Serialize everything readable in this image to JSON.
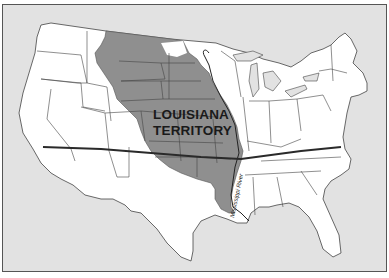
{
  "map": {
    "title": "Louisiana Territory",
    "region_label_line1": "LOUISIANA",
    "region_label_line2": "TERRITORY",
    "river_label": "Mississippi River",
    "colors": {
      "background": "#e2e2e2",
      "land": "#ffffff",
      "territory": "#8f8f8f",
      "borders": "#444444",
      "compromise_line": "#2a2a2a",
      "frame": "#555555"
    },
    "features": [
      "continental-united-states",
      "louisiana-territory-shaded",
      "latitude-line-36-30",
      "mississippi-river"
    ]
  }
}
